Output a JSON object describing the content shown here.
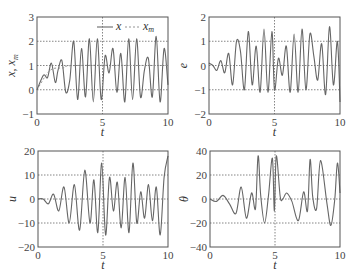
{
  "chart_data": [
    {
      "type": "line",
      "title": "",
      "xlabel": "t",
      "ylabel": "x, x_m",
      "xlim": [
        0,
        10
      ],
      "ylim": [
        -1,
        3
      ],
      "xticks": [
        "0",
        "5",
        "10"
      ],
      "yticks": [
        "-1",
        "0",
        "1",
        "2",
        "3"
      ],
      "grid": true,
      "legend": {
        "position": "upper right",
        "entries": [
          "x",
          "x_m"
        ]
      },
      "series": [
        {
          "name": "x",
          "x": [
            0,
            0.5,
            0.8,
            1.1,
            1.4,
            1.6,
            1.9,
            2.2,
            2.5,
            2.8,
            3.1,
            3.4,
            3.7,
            4.0,
            4.3,
            4.6,
            4.9,
            5.2,
            5.5,
            5.8,
            6.1,
            6.4,
            6.7,
            7.0,
            7.3,
            7.6,
            7.9,
            8.2,
            8.5,
            8.8,
            9.1,
            9.4,
            9.7,
            10
          ],
          "values": [
            0,
            0.6,
            0.5,
            1.1,
            0.3,
            0.8,
            1.2,
            -0.1,
            0.4,
            2.0,
            -0.4,
            1.7,
            -0.3,
            2.1,
            -0.5,
            2.1,
            -0.4,
            1.4,
            0.7,
            1.7,
            -0.1,
            1.5,
            -0.5,
            2.1,
            -0.4,
            2.1,
            -0.3,
            0.8,
            1.3,
            -0.3,
            2.2,
            -0.5,
            1.7,
            0.2
          ]
        },
        {
          "name": "x_m",
          "x": [
            0,
            1,
            2,
            3,
            10
          ],
          "values": [
            0,
            0.8,
            0.9,
            1.0,
            1.0
          ]
        }
      ]
    },
    {
      "type": "line",
      "xlabel": "t",
      "ylabel": "e",
      "xlim": [
        0,
        10
      ],
      "ylim": [
        -2,
        2
      ],
      "xticks": [
        "0",
        "5",
        "10"
      ],
      "yticks": [
        "-2",
        "-1",
        "0",
        "1",
        "2"
      ],
      "grid": true,
      "series": [
        {
          "name": "e",
          "x": [
            0,
            0.3,
            0.6,
            0.9,
            1.2,
            1.5,
            1.8,
            2.1,
            2.4,
            2.7,
            3.0,
            3.3,
            3.6,
            3.9,
            4.2,
            4.5,
            4.8,
            5.0,
            5.3,
            5.6,
            5.9,
            6.2,
            6.5,
            6.8,
            7.1,
            7.4,
            7.7,
            8.0,
            8.3,
            8.6,
            8.9,
            9.2,
            9.5,
            9.8,
            10
          ],
          "values": [
            0.1,
            0,
            -0.2,
            0.2,
            -0.3,
            0.5,
            -0.8,
            1.0,
            0.6,
            -1.0,
            1.4,
            -0.8,
            0.8,
            -1.1,
            1.5,
            -1.1,
            1.4,
            -1.0,
            0.3,
            -0.4,
            0.8,
            -1.1,
            1.3,
            -1.1,
            1.5,
            -1.0,
            1.3,
            0.4,
            -0.6,
            0.9,
            -1.2,
            1.6,
            -0.8,
            1.0,
            -1.5
          ]
        }
      ]
    },
    {
      "type": "line",
      "xlabel": "t",
      "ylabel": "u",
      "xlim": [
        0,
        10
      ],
      "ylim": [
        -20,
        20
      ],
      "xticks": [
        "0",
        "5",
        "10"
      ],
      "yticks": [
        "-20",
        "-10",
        "0",
        "10",
        "20"
      ],
      "grid": true,
      "series": [
        {
          "name": "u",
          "x": [
            0,
            0.4,
            0.8,
            1.2,
            1.6,
            2.0,
            2.4,
            2.8,
            3.2,
            3.6,
            4.0,
            4.3,
            4.6,
            4.9,
            5.2,
            5.5,
            5.8,
            6.1,
            6.4,
            6.7,
            7.0,
            7.3,
            7.6,
            7.9,
            8.2,
            8.5,
            8.8,
            9.1,
            9.4,
            9.7,
            10
          ],
          "values": [
            0,
            0,
            -2,
            2,
            -5,
            5,
            -10,
            6,
            -13,
            12,
            -10,
            8,
            -14,
            15,
            -15,
            9,
            -5,
            7,
            -12,
            9,
            -14,
            15,
            -10,
            3,
            -8,
            6,
            -9,
            5,
            -15,
            9,
            18
          ]
        }
      ]
    },
    {
      "type": "line",
      "xlabel": "t",
      "ylabel": "θ",
      "xlim": [
        0,
        10
      ],
      "ylim": [
        -40,
        40
      ],
      "xticks": [
        "0",
        "5",
        "10"
      ],
      "yticks": [
        "-40",
        "-20",
        "0",
        "20",
        "40"
      ],
      "grid": true,
      "series": [
        {
          "name": "θ",
          "x": [
            0,
            0.5,
            1.0,
            1.5,
            2.0,
            2.4,
            2.8,
            3.2,
            3.5,
            3.7,
            3.9,
            4.2,
            4.5,
            4.8,
            4.95,
            5.1,
            5.4,
            5.6,
            5.9,
            6.3,
            6.8,
            7.2,
            7.5,
            7.7,
            7.9,
            8.2,
            8.5,
            9.0,
            9.3,
            9.6,
            9.8,
            10
          ],
          "values": [
            0,
            -2,
            3,
            -4,
            -12,
            10,
            -16,
            5,
            -8,
            36,
            3,
            -20,
            3,
            34,
            -10,
            36,
            2,
            0,
            5,
            -2,
            -18,
            6,
            -10,
            33,
            2,
            -8,
            32,
            -4,
            -22,
            0,
            30,
            5
          ]
        }
      ]
    }
  ],
  "panels": [
    {
      "ylabel": "x, x",
      "ylabel_sub": "m",
      "xlabel": "t",
      "legend": {
        "solid": "x",
        "dashed": "x",
        "dashed_sub": "m"
      }
    },
    {
      "ylabel": "e",
      "xlabel": "t"
    },
    {
      "ylabel": "u",
      "xlabel": "t"
    },
    {
      "ylabel": "θ",
      "xlabel": "t"
    }
  ],
  "colors": {
    "curve": "#666666",
    "frame": "#555555",
    "grid": "#666666"
  }
}
